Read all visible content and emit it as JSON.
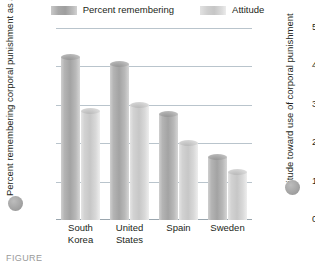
{
  "legend": {
    "items": [
      {
        "label": "Percent remembering",
        "swatch": "dark-gray-swatch",
        "color": "#a3a3a3"
      },
      {
        "label": "Attitude",
        "swatch": "light-gray-swatch",
        "color": "#c7c7c7"
      }
    ]
  },
  "axes": {
    "left_title": "Percent remembering corporal punishment as a child",
    "right_title": "Attitude toward use of corporal punishment",
    "left_ticks": [
      "100",
      "80",
      "60",
      "40",
      "20",
      "0"
    ],
    "right_ticks": [
      "5",
      "4",
      "3",
      "2",
      "1",
      "0"
    ]
  },
  "caption": "FIGURE",
  "chart_data": {
    "type": "bar",
    "title": "",
    "subtitle": "",
    "categories": [
      "South Korea",
      "United States",
      "Spain",
      "Sweden"
    ],
    "series": [
      {
        "name": "Percent remembering",
        "axis": "left",
        "color": "#a3a3a3",
        "values": [
          85,
          81,
          55,
          33
        ]
      },
      {
        "name": "Attitude",
        "axis": "right",
        "color": "#c7c7c7",
        "values": [
          2.85,
          3.0,
          2.0,
          1.25
        ]
      }
    ],
    "xlabel": "",
    "ylabel": "Percent remembering corporal punishment as a child",
    "y2label": "Attitude toward use of corporal punishment",
    "ylim": [
      0,
      100
    ],
    "y2lim": [
      0,
      5
    ],
    "yticks": [
      0,
      20,
      40,
      60,
      80,
      100
    ],
    "y2ticks": [
      0,
      1,
      2,
      3,
      4,
      5
    ],
    "grid": true,
    "legend_position": "top"
  }
}
